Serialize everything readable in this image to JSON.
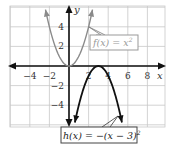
{
  "chart_data": {
    "type": "line",
    "title": "",
    "xlabel": "x",
    "ylabel": "y",
    "xlim": [
      -6,
      10
    ],
    "ylim": [
      -6,
      6
    ],
    "grid": true,
    "grid_step": 2,
    "x_ticks": [
      -4,
      -2,
      2,
      4,
      6,
      8
    ],
    "x_tick_labels": [
      "−4",
      "−2",
      "2",
      "4",
      "6",
      "8"
    ],
    "y_ticks": [
      4,
      2,
      -2,
      -4
    ],
    "y_tick_labels": [
      "4",
      "2",
      "−2",
      "−4"
    ],
    "series": [
      {
        "name": "f(x) = x²",
        "function": "x^2",
        "color": "#8a8a8a",
        "x": [
          -2.4,
          -2,
          -1,
          0,
          1,
          2,
          2.4
        ],
        "y": [
          5.76,
          4,
          1,
          0,
          1,
          4,
          5.76
        ]
      },
      {
        "name": "h(x) = −(x − 3)²",
        "function": "-(x-3)^2",
        "color": "#111111",
        "x": [
          0.6,
          1,
          2,
          3,
          4,
          5,
          5.4
        ],
        "y": [
          -5.76,
          -4,
          -1,
          0,
          -1,
          -4,
          -5.76
        ]
      }
    ],
    "annotations": [
      {
        "text": "f(x) = x²",
        "points_to": [
          2,
          4
        ]
      },
      {
        "text": "h(x) = −(x − 3)²",
        "points_to": [
          5,
          -4
        ]
      }
    ]
  },
  "labels": {
    "x_axis": "x",
    "y_axis": "y",
    "f_label_main": "f(x) = x",
    "f_label_exp": "2",
    "h_label_main": "h(x) = −(x − 3)",
    "h_label_exp": "2"
  },
  "colors": {
    "grid": "#c8c8c8",
    "axis": "#111111",
    "f_curve": "#8a8a8a",
    "h_curve": "#111111",
    "f_label_text": "#8a8a8a"
  }
}
